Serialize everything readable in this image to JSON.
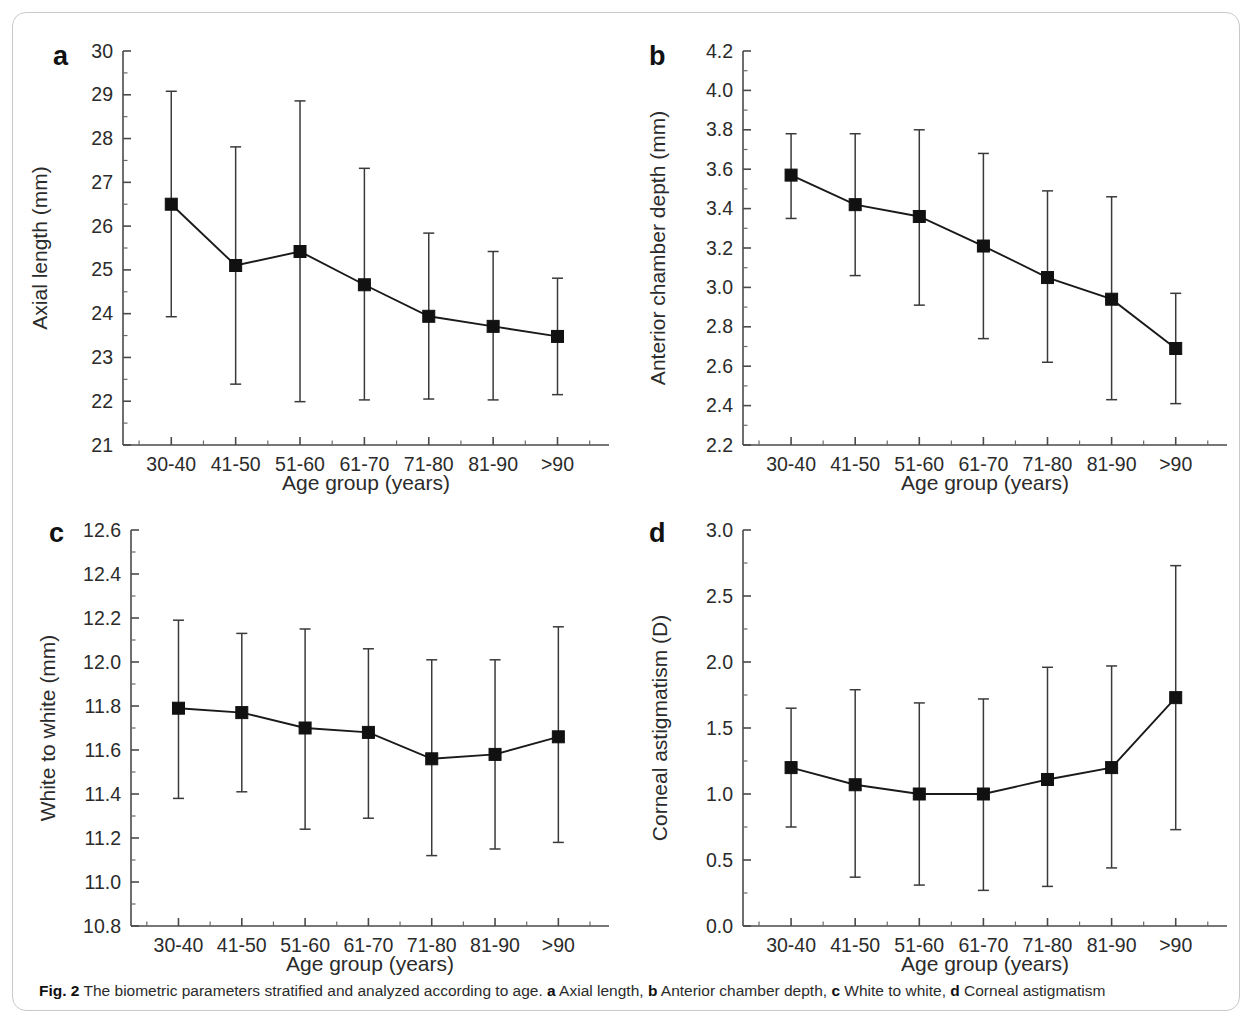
{
  "figure": {
    "caption_label": "Fig. 2",
    "caption_text": " The biometric parameters stratified and analyzed according to age. ",
    "caption_parts": [
      {
        "letter": "a",
        "text": " Axial length, "
      },
      {
        "letter": "b",
        "text": " Anterior chamber depth, "
      },
      {
        "letter": "c",
        "text": " White to white, "
      },
      {
        "letter": "d",
        "text": " Corneal astigmatism"
      }
    ]
  },
  "chart_data": [
    {
      "panel": "a",
      "type": "line",
      "title": "",
      "xlabel": "Age group (years)",
      "ylabel": "Axial length (mm)",
      "categories": [
        "30-40",
        "41-50",
        "51-60",
        "61-70",
        "71-80",
        "81-90",
        ">90"
      ],
      "values": [
        26.5,
        25.1,
        25.42,
        24.66,
        23.94,
        23.71,
        23.48
      ],
      "err_low": [
        23.93,
        22.39,
        21.99,
        22.03,
        22.05,
        22.03,
        22.15
      ],
      "err_high": [
        29.08,
        27.81,
        28.86,
        27.32,
        25.84,
        25.42,
        24.81
      ],
      "ylim": [
        21,
        30
      ],
      "yticks": [
        21,
        22,
        23,
        24,
        25,
        26,
        27,
        28,
        29,
        30
      ],
      "ytick_labels": [
        "21",
        "22",
        "23",
        "24",
        "25",
        "26",
        "27",
        "28",
        "29",
        "30"
      ],
      "y_minor_step": 0.5,
      "grid": false,
      "legend": "none"
    },
    {
      "panel": "b",
      "type": "line",
      "title": "",
      "xlabel": "Age group (years)",
      "ylabel": "Anterior chamber depth (mm)",
      "categories": [
        "30-40",
        "41-50",
        "51-60",
        "61-70",
        "71-80",
        "81-90",
        ">90"
      ],
      "values": [
        3.57,
        3.42,
        3.36,
        3.21,
        3.05,
        2.94,
        2.69
      ],
      "err_low": [
        3.35,
        3.06,
        2.91,
        2.74,
        2.62,
        2.43,
        2.41
      ],
      "err_high": [
        3.78,
        3.78,
        3.8,
        3.68,
        3.49,
        3.46,
        2.97
      ],
      "ylim": [
        2.2,
        4.2
      ],
      "yticks": [
        2.2,
        2.4,
        2.6,
        2.8,
        3.0,
        3.2,
        3.4,
        3.6,
        3.8,
        4.0,
        4.2
      ],
      "ytick_labels": [
        "2.2",
        "2.4",
        "2.6",
        "2.8",
        "3.0",
        "3.2",
        "3.4",
        "3.6",
        "3.8",
        "4.0",
        "4.2"
      ],
      "y_minor_step": 0.1,
      "grid": false,
      "legend": "none"
    },
    {
      "panel": "c",
      "type": "line",
      "title": "",
      "xlabel": "Age group (years)",
      "ylabel": "White to white (mm)",
      "categories": [
        "30-40",
        "41-50",
        "51-60",
        "61-70",
        "71-80",
        "81-90",
        ">90"
      ],
      "values": [
        11.79,
        11.77,
        11.7,
        11.68,
        11.56,
        11.58,
        11.66
      ],
      "err_low": [
        11.38,
        11.41,
        11.24,
        11.29,
        11.12,
        11.15,
        11.18
      ],
      "err_high": [
        12.19,
        12.13,
        12.15,
        12.06,
        12.01,
        12.01,
        12.16
      ],
      "ylim": [
        10.8,
        12.6
      ],
      "yticks": [
        10.8,
        11.0,
        11.2,
        11.4,
        11.6,
        11.8,
        12.0,
        12.2,
        12.4,
        12.6
      ],
      "ytick_labels": [
        "10.8",
        "11.0",
        "11.2",
        "11.4",
        "11.6",
        "11.8",
        "12.0",
        "12.2",
        "12.4",
        "12.6"
      ],
      "y_minor_step": 0.1,
      "grid": false,
      "legend": "none"
    },
    {
      "panel": "d",
      "type": "line",
      "title": "",
      "xlabel": "Age group (years)",
      "ylabel": "Corneal astigmatism (D)",
      "categories": [
        "30-40",
        "41-50",
        "51-60",
        "61-70",
        "71-80",
        "81-90",
        ">90"
      ],
      "values": [
        1.2,
        1.07,
        1.0,
        1.0,
        1.11,
        1.2,
        1.73
      ],
      "err_low": [
        0.75,
        0.37,
        0.31,
        0.27,
        0.3,
        0.44,
        0.73
      ],
      "err_high": [
        1.65,
        1.79,
        1.69,
        1.72,
        1.96,
        1.97,
        2.73
      ],
      "ylim": [
        0.0,
        3.0
      ],
      "yticks": [
        0.0,
        0.5,
        1.0,
        1.5,
        2.0,
        2.5,
        3.0
      ],
      "ytick_labels": [
        "0.0",
        "0.5",
        "1.0",
        "1.5",
        "2.0",
        "2.5",
        "3.0"
      ],
      "y_minor_step": 0.25,
      "grid": false,
      "legend": "none"
    }
  ]
}
